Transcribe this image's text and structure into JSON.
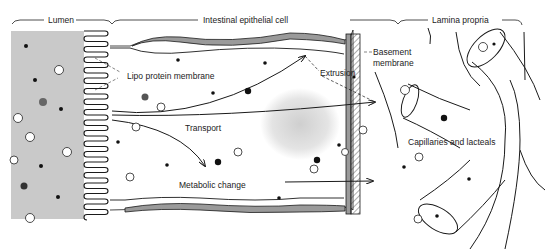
{
  "diagram": {
    "regions": {
      "lumen": "Lumen",
      "cell": "Intestinal epithelial cell",
      "lamina": "Lamina propria"
    },
    "labels": {
      "lipoprotein": "Lipo protein membrane",
      "extrusion": "Extrusion",
      "transport": "Transport",
      "metabolic": "Metabolic change",
      "basement_line1": "Basement",
      "basement_line2": "membrane",
      "capillaries": "Capillaries and lacteals"
    },
    "colors": {
      "lumen_fill": "#c9c9c9",
      "membrane_fill": "#9a9a9a",
      "stroke": "#1a1a1a",
      "background": "#ffffff"
    }
  }
}
